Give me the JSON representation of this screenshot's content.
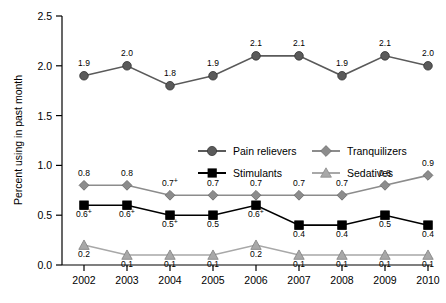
{
  "chart_data": {
    "type": "line",
    "title": "",
    "xlabel": "",
    "ylabel": "Percent using in past month",
    "categories": [
      "2002",
      "2003",
      "2004",
      "2005",
      "2006",
      "2007",
      "2008",
      "2009",
      "2010"
    ],
    "ylim": [
      0.0,
      2.5
    ],
    "yticks": [
      "0.0",
      "0.5",
      "1.0",
      "1.5",
      "2.0",
      "2.5"
    ],
    "grid": false,
    "legend_position": "center",
    "series": [
      {
        "name": "Pain relievers",
        "color": "#5a5a5a",
        "marker": "circle",
        "values": [
          1.9,
          2.0,
          1.8,
          1.9,
          2.1,
          2.1,
          1.9,
          2.1,
          2.0
        ],
        "labels": [
          "1.9",
          "2.0",
          "1.8",
          "1.9",
          "2.1",
          "2.1",
          "1.9",
          "2.1",
          "2.0"
        ]
      },
      {
        "name": "Tranquilizers",
        "color": "#8c8c8c",
        "marker": "diamond",
        "values": [
          0.8,
          0.8,
          0.7,
          0.7,
          0.7,
          0.7,
          0.7,
          0.8,
          0.9
        ],
        "labels": [
          "0.8",
          "0.8",
          "0.7 +",
          "0.7",
          "0.7",
          "0.7",
          "0.7",
          "0.8",
          "0.9"
        ]
      },
      {
        "name": "Stimulants",
        "color": "#000000",
        "marker": "square",
        "values": [
          0.6,
          0.6,
          0.5,
          0.5,
          0.6,
          0.4,
          0.4,
          0.5,
          0.4
        ],
        "labels": [
          "0.6 +",
          "0.6 +",
          "0.5 +",
          "0.5",
          "0.6 +",
          "0.4",
          "0.4",
          "0.5",
          "0.4"
        ]
      },
      {
        "name": "Sedatives",
        "color": "#a8a8a8",
        "marker": "triangle",
        "values": [
          0.2,
          0.1,
          0.1,
          0.1,
          0.2,
          0.1,
          0.1,
          0.1,
          0.1
        ],
        "labels": [
          "0.2",
          "0.1",
          "0.1",
          "0.1",
          "0.2",
          "0.1",
          "0.1",
          "0.1",
          "0.1"
        ]
      }
    ]
  }
}
